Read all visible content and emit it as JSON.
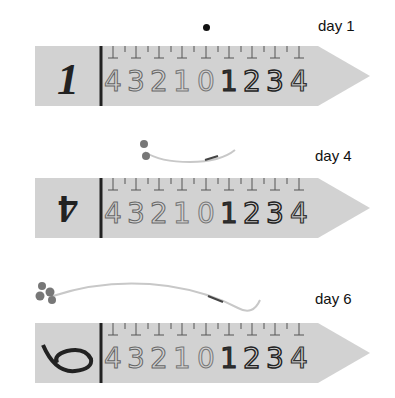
{
  "panels": [
    {
      "label": "day 1",
      "marker": "1",
      "scale_digits": [
        "4",
        "3",
        "2",
        "1",
        "0",
        "1",
        "2",
        "3",
        "4"
      ],
      "seedling": "seed-dot"
    },
    {
      "label": "day 4",
      "marker": "4",
      "scale_digits": [
        "4",
        "3",
        "2",
        "1",
        "0",
        "1",
        "2",
        "3",
        "4"
      ],
      "seedling": "short-sprout"
    },
    {
      "label": "day 6",
      "marker": "6",
      "scale_digits": [
        "4",
        "3",
        "2",
        "1",
        "0",
        "1",
        "2",
        "3",
        "4"
      ],
      "seedling": "long-sprout"
    }
  ],
  "colors": {
    "ruler": "#d2d2d2",
    "ink": "#222222",
    "sprout": "#c8c8c8",
    "leaf": "#777777"
  }
}
